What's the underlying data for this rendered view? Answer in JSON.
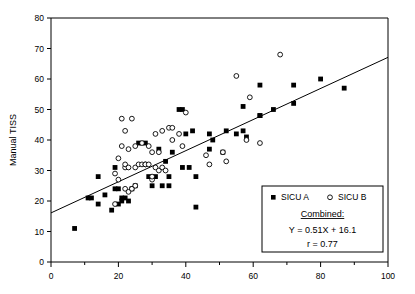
{
  "chart_data": {
    "type": "scatter",
    "title": "",
    "xlabel": "",
    "ylabel": "Manual TISS",
    "xlim": [
      0,
      100
    ],
    "ylim": [
      0,
      80
    ],
    "xticks": [
      0,
      20,
      40,
      60,
      80,
      100
    ],
    "yticks": [
      0,
      10,
      20,
      30,
      40,
      50,
      60,
      70,
      80
    ],
    "x_minor_tick_step": 10,
    "grid": false,
    "legend_position": "lower-right",
    "series": [
      {
        "name": "SICU A",
        "marker": "filled-square",
        "points": [
          [
            7,
            11
          ],
          [
            11,
            21
          ],
          [
            12,
            21
          ],
          [
            14,
            19
          ],
          [
            14,
            28
          ],
          [
            16,
            22
          ],
          [
            18,
            17
          ],
          [
            19,
            31
          ],
          [
            19,
            24
          ],
          [
            20,
            24
          ],
          [
            20,
            19
          ],
          [
            21,
            21
          ],
          [
            21,
            20
          ],
          [
            22,
            21
          ],
          [
            23,
            20
          ],
          [
            24,
            24
          ],
          [
            25,
            25
          ],
          [
            26,
            39
          ],
          [
            28,
            39
          ],
          [
            29,
            28
          ],
          [
            30,
            25
          ],
          [
            31,
            28
          ],
          [
            32,
            37
          ],
          [
            33,
            25
          ],
          [
            34,
            33
          ],
          [
            35,
            25
          ],
          [
            35,
            28
          ],
          [
            36,
            36
          ],
          [
            38,
            50
          ],
          [
            39,
            50
          ],
          [
            39,
            31
          ],
          [
            40,
            42
          ],
          [
            41,
            31
          ],
          [
            42,
            43
          ],
          [
            43,
            28
          ],
          [
            43,
            18
          ],
          [
            47,
            37
          ],
          [
            47,
            42
          ],
          [
            48,
            40
          ],
          [
            51,
            36
          ],
          [
            52,
            43
          ],
          [
            55,
            42
          ],
          [
            57,
            43
          ],
          [
            57,
            51
          ],
          [
            58,
            41
          ],
          [
            62,
            48
          ],
          [
            62,
            48
          ],
          [
            62,
            58
          ],
          [
            66,
            50
          ],
          [
            72,
            52
          ],
          [
            72,
            58
          ],
          [
            80,
            60
          ],
          [
            87,
            57
          ]
        ]
      },
      {
        "name": "SICU B",
        "marker": "open-circle",
        "points": [
          [
            19,
            19
          ],
          [
            19,
            29
          ],
          [
            20,
            27
          ],
          [
            20,
            34
          ],
          [
            21,
            38
          ],
          [
            21,
            47
          ],
          [
            22,
            31
          ],
          [
            22,
            32
          ],
          [
            22,
            43
          ],
          [
            22,
            24
          ],
          [
            23,
            23
          ],
          [
            23,
            31
          ],
          [
            23,
            37
          ],
          [
            24,
            24
          ],
          [
            24,
            47
          ],
          [
            25,
            25
          ],
          [
            25,
            31
          ],
          [
            25,
            38
          ],
          [
            26,
            32
          ],
          [
            27,
            32
          ],
          [
            27,
            39
          ],
          [
            28,
            32
          ],
          [
            28,
            32
          ],
          [
            29,
            32
          ],
          [
            29,
            38
          ],
          [
            30,
            27
          ],
          [
            30,
            36
          ],
          [
            30,
            28
          ],
          [
            31,
            31
          ],
          [
            31,
            42
          ],
          [
            32,
            36
          ],
          [
            32,
            30
          ],
          [
            33,
            43
          ],
          [
            33,
            31
          ],
          [
            34,
            30
          ],
          [
            35,
            44
          ],
          [
            36,
            44
          ],
          [
            36,
            40
          ],
          [
            38,
            42
          ],
          [
            39,
            38
          ],
          [
            40,
            49
          ],
          [
            46,
            35
          ],
          [
            47,
            32
          ],
          [
            51,
            36
          ],
          [
            52,
            33
          ],
          [
            55,
            61
          ],
          [
            58,
            40
          ],
          [
            59,
            54
          ],
          [
            62,
            39
          ],
          [
            68,
            68
          ]
        ]
      }
    ],
    "fit_line": {
      "label": "Combined",
      "slope": 0.51,
      "intercept": 16.1,
      "x_start": 0,
      "x_end": 100,
      "correlation": 0.77
    }
  },
  "legend": {
    "series_a_label": "SICU A",
    "series_b_label": "SICU B",
    "combined_heading": "Combined:",
    "equation": "Y = 0.51X + 16.1",
    "correlation_text": "r = 0.77"
  },
  "axes": {
    "y_title": "Manual TISS",
    "x_tick_labels": [
      "0",
      "20",
      "40",
      "60",
      "80",
      "100"
    ],
    "y_tick_labels": [
      "0",
      "10",
      "20",
      "30",
      "40",
      "50",
      "60",
      "70",
      "80"
    ]
  }
}
